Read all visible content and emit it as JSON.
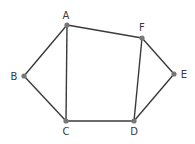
{
  "diagram": {
    "type": "graph",
    "nodes": [
      {
        "id": "A",
        "label": "A",
        "x": 67,
        "y": 25,
        "lx": 66,
        "ly": 19
      },
      {
        "id": "B",
        "label": "B",
        "x": 24,
        "y": 76,
        "lx": 14,
        "ly": 80
      },
      {
        "id": "C",
        "label": "C",
        "x": 66,
        "y": 121,
        "lx": 66,
        "ly": 135
      },
      {
        "id": "D",
        "label": "D",
        "x": 134,
        "y": 121,
        "lx": 134,
        "ly": 135
      },
      {
        "id": "E",
        "label": "E",
        "x": 174,
        "y": 74,
        "lx": 184,
        "ly": 78
      },
      {
        "id": "F",
        "label": "F",
        "x": 142,
        "y": 38,
        "lx": 142,
        "ly": 31
      }
    ],
    "edges": [
      [
        "A",
        "B"
      ],
      [
        "B",
        "C"
      ],
      [
        "A",
        "C"
      ],
      [
        "A",
        "F"
      ],
      [
        "C",
        "D"
      ],
      [
        "D",
        "F"
      ],
      [
        "F",
        "E"
      ],
      [
        "E",
        "D"
      ]
    ]
  },
  "colors": {
    "edge": "#3a3a3a",
    "node": "#777777",
    "label": "#3a3a3a"
  }
}
